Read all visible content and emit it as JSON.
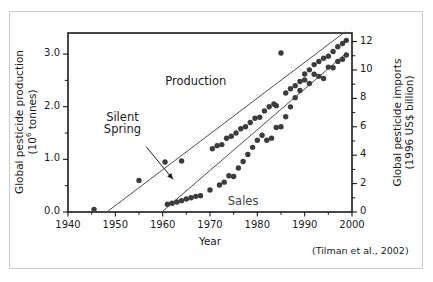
{
  "figure": {
    "citation": "(Tilman et al., 2002)",
    "background": "#ffffff",
    "frame_color": "#c9c9c9"
  },
  "chart_data": {
    "type": "scatter",
    "title": "",
    "xlabel": "Year",
    "ylabel": "Global pesticide production (10⁶ tonnes)",
    "y2label": "Global pesticide imports (1996 US$ billion)",
    "xlim": [
      1940,
      2000
    ],
    "ylim": [
      0.0,
      3.4
    ],
    "y2lim": [
      0,
      12.6
    ],
    "xticks": [
      1940,
      1950,
      1960,
      1970,
      1980,
      1990,
      2000
    ],
    "xticklabels": [
      "1940",
      "1950",
      "1960",
      "1970",
      "1980",
      "1990",
      "2000"
    ],
    "yticks": [
      0.0,
      1.0,
      2.0,
      3.0
    ],
    "yticklabels": [
      "0.0",
      "1.0",
      "2.0",
      "3.0"
    ],
    "yminorticks": [
      0.5,
      1.5,
      2.5
    ],
    "y2ticks": [
      0,
      2,
      4,
      6,
      8,
      10,
      12
    ],
    "y2ticklabels": [
      "0",
      "2",
      "4",
      "6",
      "8",
      "10",
      "12"
    ],
    "grid": false,
    "legend": "inline-labels",
    "dot_color": "#3c3c3c",
    "line_color": "#4c4c4c",
    "series": [
      {
        "name": "Production",
        "axis": "left",
        "label_text": "Production",
        "label_x": 1967,
        "label_y": 2.45,
        "trendline": {
          "x0": 1948.2,
          "y0": 0.0,
          "x1": 1998.5,
          "y1": 3.42
        },
        "points": [
          {
            "x": 1945.5,
            "y": 0.05
          },
          {
            "x": 1955.0,
            "y": 0.6
          },
          {
            "x": 1960.5,
            "y": 0.95
          },
          {
            "x": 1964.0,
            "y": 0.97
          },
          {
            "x": 1970.5,
            "y": 1.2
          },
          {
            "x": 1971.5,
            "y": 1.26
          },
          {
            "x": 1972.5,
            "y": 1.28
          },
          {
            "x": 1973.5,
            "y": 1.4
          },
          {
            "x": 1974.5,
            "y": 1.44
          },
          {
            "x": 1975.5,
            "y": 1.5
          },
          {
            "x": 1976.5,
            "y": 1.58
          },
          {
            "x": 1977.5,
            "y": 1.62
          },
          {
            "x": 1978.5,
            "y": 1.7
          },
          {
            "x": 1979.5,
            "y": 1.78
          },
          {
            "x": 1980.5,
            "y": 1.8
          },
          {
            "x": 1981.5,
            "y": 1.92
          },
          {
            "x": 1982.5,
            "y": 2.0
          },
          {
            "x": 1983.5,
            "y": 2.05
          },
          {
            "x": 1984.0,
            "y": 2.02
          },
          {
            "x": 1985.0,
            "y": 3.02
          },
          {
            "x": 1986.0,
            "y": 2.26
          },
          {
            "x": 1987.0,
            "y": 2.34
          },
          {
            "x": 1988.0,
            "y": 2.4
          },
          {
            "x": 1989.0,
            "y": 2.48
          },
          {
            "x": 1990.0,
            "y": 2.62
          },
          {
            "x": 1991.0,
            "y": 2.7
          },
          {
            "x": 1992.0,
            "y": 2.8
          },
          {
            "x": 1993.0,
            "y": 2.86
          },
          {
            "x": 1994.0,
            "y": 2.92
          },
          {
            "x": 1995.0,
            "y": 2.96
          },
          {
            "x": 1996.0,
            "y": 3.05
          },
          {
            "x": 1997.0,
            "y": 3.14
          },
          {
            "x": 1998.0,
            "y": 3.2
          },
          {
            "x": 1998.8,
            "y": 3.26
          }
        ]
      },
      {
        "name": "Sales",
        "axis": "right",
        "label_text": "Sales",
        "label_x": 1977,
        "label_y": 0.62,
        "trendline": {
          "x0": 1959.8,
          "y0": 0.0,
          "x1": 1998.5,
          "y1": 11.1
        },
        "points": [
          {
            "x": 1961.0,
            "y": 0.55
          },
          {
            "x": 1962.0,
            "y": 0.62
          },
          {
            "x": 1963.0,
            "y": 0.7
          },
          {
            "x": 1964.0,
            "y": 0.8
          },
          {
            "x": 1965.0,
            "y": 0.92
          },
          {
            "x": 1966.0,
            "y": 1.0
          },
          {
            "x": 1967.0,
            "y": 1.1
          },
          {
            "x": 1968.0,
            "y": 1.14
          },
          {
            "x": 1970.0,
            "y": 1.55
          },
          {
            "x": 1972.0,
            "y": 1.9
          },
          {
            "x": 1973.0,
            "y": 2.1
          },
          {
            "x": 1974.0,
            "y": 2.55
          },
          {
            "x": 1975.0,
            "y": 2.5
          },
          {
            "x": 1976.0,
            "y": 3.1
          },
          {
            "x": 1977.0,
            "y": 3.55
          },
          {
            "x": 1978.0,
            "y": 4.05
          },
          {
            "x": 1979.0,
            "y": 4.55
          },
          {
            "x": 1980.0,
            "y": 5.05
          },
          {
            "x": 1981.0,
            "y": 5.4
          },
          {
            "x": 1982.0,
            "y": 5.05
          },
          {
            "x": 1983.0,
            "y": 5.2
          },
          {
            "x": 1984.0,
            "y": 5.95
          },
          {
            "x": 1985.0,
            "y": 6.0
          },
          {
            "x": 1986.0,
            "y": 6.7
          },
          {
            "x": 1987.0,
            "y": 7.4
          },
          {
            "x": 1988.0,
            "y": 8.05
          },
          {
            "x": 1989.0,
            "y": 8.55
          },
          {
            "x": 1990.0,
            "y": 9.3
          },
          {
            "x": 1991.0,
            "y": 9.05
          },
          {
            "x": 1992.0,
            "y": 9.7
          },
          {
            "x": 1993.0,
            "y": 9.55
          },
          {
            "x": 1994.0,
            "y": 9.4
          },
          {
            "x": 1995.0,
            "y": 10.2
          },
          {
            "x": 1996.0,
            "y": 10.15
          },
          {
            "x": 1997.0,
            "y": 10.6
          },
          {
            "x": 1998.0,
            "y": 10.75
          },
          {
            "x": 1998.8,
            "y": 11.05
          }
        ]
      }
    ],
    "annotations": [
      {
        "name": "silent-spring",
        "text_line1": "Silent",
        "text_line2": "Spring",
        "text_x": 1951.5,
        "text_y": 1.7,
        "arrow_from_x": 1956.5,
        "arrow_from_y": 1.24,
        "arrow_to_x": 1962.2,
        "arrow_to_y": 0.62
      }
    ]
  }
}
